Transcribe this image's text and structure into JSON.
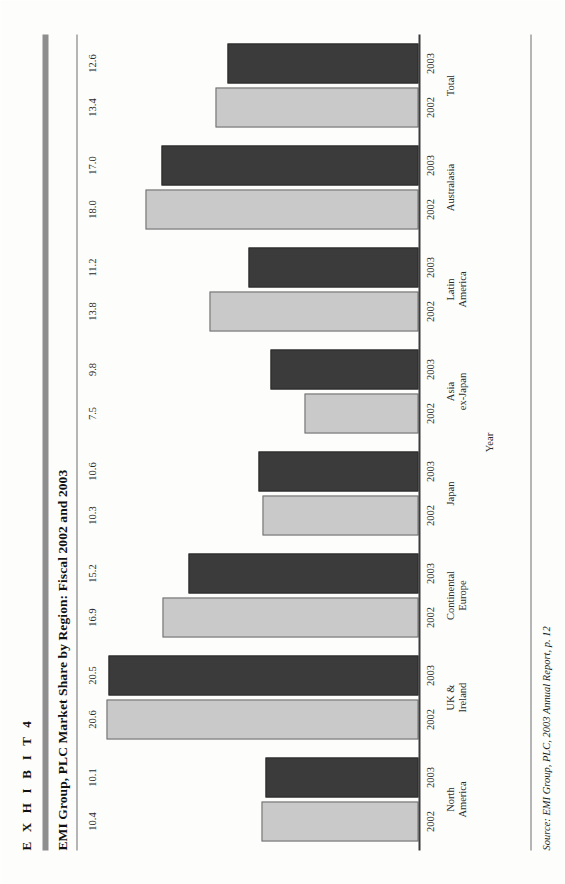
{
  "exhibit": {
    "label": "E X H I B I T   4",
    "title": "EMI Group, PLC Market Share by Region: Fiscal 2002 and 2003"
  },
  "source": {
    "lead": "Source:",
    "text": " EMI Group, PLC, 2003 Annual Report, p. 12"
  },
  "axis": {
    "category_title": "Year"
  },
  "chart_data": {
    "type": "bar",
    "title": "EMI Group, PLC Market Share by Region: Fiscal 2002 and 2003",
    "xlabel": "Year",
    "ylabel": "",
    "ylim": [
      0,
      21
    ],
    "grid": false,
    "legend": "none",
    "orientation": "horizontal-in-screenshot (page rotated 90 degrees)",
    "categories": [
      "North America",
      "UK & Ireland",
      "Continental Europe",
      "Japan",
      "Asia ex-Japan",
      "Latin America",
      "Australasia",
      "Total"
    ],
    "category_lines": [
      [
        "North",
        "America"
      ],
      [
        "UK &",
        "Ireland"
      ],
      [
        "Continental",
        "Europe"
      ],
      [
        "Japan",
        ""
      ],
      [
        "Asia",
        "ex-Japan"
      ],
      [
        "Latin",
        "America"
      ],
      [
        "Australasia",
        ""
      ],
      [
        "Total",
        ""
      ]
    ],
    "tick_labels": [
      "2002",
      "2003"
    ],
    "series": [
      {
        "name": "2002",
        "color": "#c9c9c9",
        "values": [
          10.4,
          20.6,
          16.9,
          10.3,
          7.5,
          13.8,
          18.0,
          13.4
        ]
      },
      {
        "name": "2003",
        "color": "#3b3b3b",
        "values": [
          10.1,
          20.5,
          15.2,
          10.6,
          9.8,
          11.2,
          17.0,
          12.6
        ]
      }
    ],
    "groups": [
      {
        "region": "North America",
        "line1": "North",
        "line2": "America",
        "bars": [
          {
            "year": "2002",
            "value": 10.4,
            "label": "10.4"
          },
          {
            "year": "2003",
            "value": 10.1,
            "label": "10.1"
          }
        ]
      },
      {
        "region": "UK & Ireland",
        "line1": "UK &",
        "line2": "Ireland",
        "bars": [
          {
            "year": "2002",
            "value": 20.6,
            "label": "20.6"
          },
          {
            "year": "2003",
            "value": 20.5,
            "label": "20.5"
          }
        ]
      },
      {
        "region": "Continental Europe",
        "line1": "Continental",
        "line2": "Europe",
        "bars": [
          {
            "year": "2002",
            "value": 16.9,
            "label": "16.9"
          },
          {
            "year": "2003",
            "value": 15.2,
            "label": "15.2"
          }
        ]
      },
      {
        "region": "Japan",
        "line1": "Japan",
        "line2": "",
        "bars": [
          {
            "year": "2002",
            "value": 10.3,
            "label": "10.3"
          },
          {
            "year": "2003",
            "value": 10.6,
            "label": "10.6"
          }
        ]
      },
      {
        "region": "Asia ex-Japan",
        "line1": "Asia",
        "line2": "ex-Japan",
        "bars": [
          {
            "year": "2002",
            "value": 7.5,
            "label": "7.5"
          },
          {
            "year": "2003",
            "value": 9.8,
            "label": "9.8"
          }
        ]
      },
      {
        "region": "Latin America",
        "line1": "Latin",
        "line2": "America",
        "bars": [
          {
            "year": "2002",
            "value": 13.8,
            "label": "13.8"
          },
          {
            "year": "2003",
            "value": 11.2,
            "label": "11.2"
          }
        ]
      },
      {
        "region": "Australasia",
        "line1": "Australasia",
        "line2": "",
        "bars": [
          {
            "year": "2002",
            "value": 18.0,
            "label": "18.0"
          },
          {
            "year": "2003",
            "value": 17.0,
            "label": "17.0"
          }
        ]
      },
      {
        "region": "Total",
        "line1": "Total",
        "line2": "",
        "bars": [
          {
            "year": "2002",
            "value": 13.4,
            "label": "13.4"
          },
          {
            "year": "2003",
            "value": 12.6,
            "label": "12.6"
          }
        ]
      }
    ]
  },
  "colors": {
    "bar_2002": "#c9c9c9",
    "bar_2003": "#3b3b3b",
    "rule": "#8e8e8e",
    "axis": "#3b3b3b",
    "page": "#fdfdfc"
  }
}
